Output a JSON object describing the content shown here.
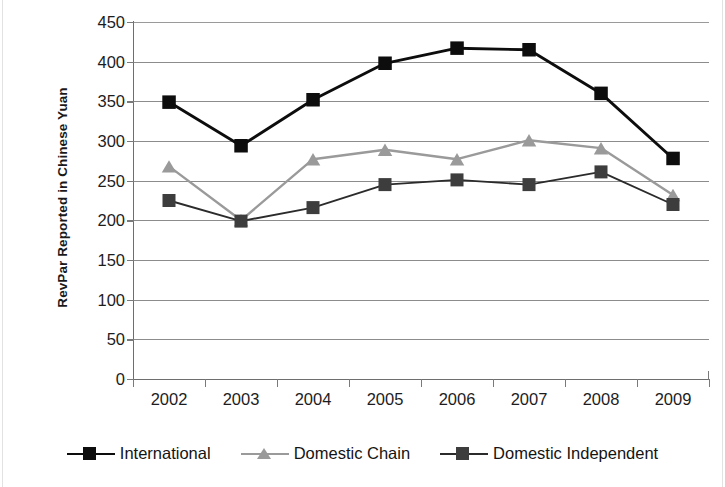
{
  "chart_data": {
    "type": "line",
    "title": "",
    "xlabel": "",
    "ylabel": "RevPar Reported in Chinese Yuan",
    "categories": [
      "2002",
      "2003",
      "2004",
      "2005",
      "2006",
      "2007",
      "2008",
      "2009"
    ],
    "x": [
      2002,
      2003,
      2004,
      2005,
      2006,
      2007,
      2008,
      2009
    ],
    "ylim": [
      0,
      450
    ],
    "ytick_labels": [
      "0",
      "50",
      "100",
      "150",
      "200",
      "250",
      "300",
      "350",
      "400",
      "450"
    ],
    "ytick_values": [
      0,
      50,
      100,
      150,
      200,
      250,
      300,
      350,
      400,
      450
    ],
    "grid": "horizontal",
    "legend_position": "bottom",
    "series": [
      {
        "name": "International",
        "marker": "square",
        "color": "#0d0d0d",
        "line_color": "#0d0d0d",
        "values": [
          349,
          294,
          352,
          398,
          417,
          415,
          360,
          278
        ]
      },
      {
        "name": "Domestic Chain",
        "marker": "triangle",
        "color": "#9a9a9a",
        "line_color": "#9a9a9a",
        "values": [
          268,
          200,
          277,
          289,
          277,
          301,
          291,
          232
        ]
      },
      {
        "name": "Domestic Independent",
        "marker": "square",
        "color": "#3d3d3d",
        "line_color": "#2b2b2b",
        "values": [
          225,
          199,
          216,
          245,
          251,
          245,
          261,
          220
        ]
      }
    ]
  },
  "axis": {
    "y_title": "RevPar Reported in Chinese Yuan"
  },
  "legend": {
    "items": [
      {
        "label": "International"
      },
      {
        "label": "Domestic Chain"
      },
      {
        "label": "Domestic Independent"
      }
    ]
  }
}
